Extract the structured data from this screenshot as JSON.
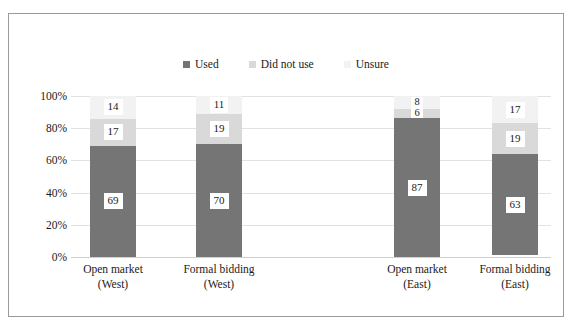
{
  "chart_data": {
    "type": "bar",
    "subtype": "100% stacked column",
    "title": "",
    "xlabel": "",
    "ylabel": "",
    "ylim": [
      0,
      100
    ],
    "yticks": [
      "0%",
      "20%",
      "40%",
      "60%",
      "80%",
      "100%"
    ],
    "grid": true,
    "legend_position": "top-center",
    "categories": [
      {
        "line1": "Open market",
        "line2": "(West)"
      },
      {
        "line1": "Formal bidding",
        "line2": "(West)"
      },
      {
        "line1": "Open market",
        "line2": "(East)"
      },
      {
        "line1": "Formal bidding",
        "line2": "(East)"
      }
    ],
    "series": [
      {
        "name": "Used",
        "color": "#757575",
        "values": [
          69,
          70,
          87,
          63
        ]
      },
      {
        "name": "Did not use",
        "color": "#d9d9d9",
        "values": [
          17,
          19,
          6,
          19
        ]
      },
      {
        "name": "Unsure",
        "color": "#f2f2f2",
        "values": [
          14,
          11,
          8,
          17
        ]
      }
    ]
  },
  "legend": {
    "items": [
      {
        "label": "Used",
        "color": "#757575"
      },
      {
        "label": "Did not use",
        "color": "#d9d9d9"
      },
      {
        "label": "Unsure",
        "color": "#f2f2f2"
      }
    ]
  }
}
